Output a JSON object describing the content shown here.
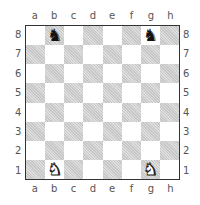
{
  "files": [
    "a",
    "b",
    "c",
    "d",
    "e",
    "f",
    "g",
    "h"
  ],
  "ranks": [
    "8",
    "7",
    "6",
    "5",
    "4",
    "3",
    "2",
    "1"
  ],
  "colors": {
    "dark_square": "#d4d4d4",
    "light_square": "#ffffff",
    "border": "#333333"
  },
  "pieces": [
    {
      "square": "b8",
      "type": "knight",
      "color": "black",
      "glyph": "♞"
    },
    {
      "square": "g8",
      "type": "knight",
      "color": "black",
      "glyph": "♞"
    },
    {
      "square": "b1",
      "type": "knight",
      "color": "white",
      "glyph": "♞"
    },
    {
      "square": "g1",
      "type": "knight",
      "color": "white",
      "glyph": "♞"
    }
  ]
}
